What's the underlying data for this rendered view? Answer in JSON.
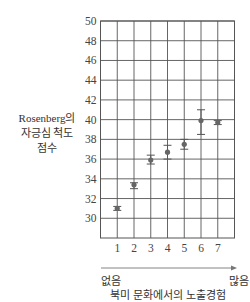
{
  "chart_data": {
    "type": "scatter",
    "title": "",
    "xlabel": "북미 문화에서의 노출경험",
    "ylabel_lines": [
      "Rosenberg의",
      "자긍심 척도",
      "점수"
    ],
    "x_direction_labels": {
      "low": "없음",
      "high": "많음"
    },
    "categories": [
      "1",
      "2",
      "3",
      "4",
      "5",
      "6",
      "7"
    ],
    "ylim": [
      28,
      50
    ],
    "yticks": [
      30,
      32,
      34,
      36,
      38,
      40,
      42,
      44,
      46,
      48,
      50
    ],
    "grid": true,
    "series": [
      {
        "name": "자긍심 점수",
        "values": [
          31.0,
          33.4,
          35.9,
          36.7,
          37.5,
          39.9,
          39.7
        ],
        "error_low": [
          30.8,
          33.0,
          35.5,
          36.0,
          37.0,
          38.5,
          39.5
        ],
        "error_high": [
          31.2,
          33.6,
          36.4,
          37.4,
          38.0,
          41.0,
          39.9
        ]
      }
    ]
  }
}
